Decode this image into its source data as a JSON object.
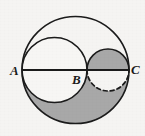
{
  "figure": {
    "background_color": "#f5f4f2",
    "stroke_color": "#1b1b1b",
    "shade_color": "#a8a8a8",
    "unshaded_color": "#f7f6f4",
    "canvas": {
      "width": 145,
      "height": 136
    },
    "baseline": {
      "y": 70,
      "x_start": 22,
      "x_end": 129,
      "name": "diameter-line-AC"
    },
    "points": [
      {
        "id": "A",
        "label": "A",
        "x": 22,
        "y": 70,
        "label_x": 10,
        "label_y": 75
      },
      {
        "id": "B",
        "label": "B",
        "x": 87,
        "y": 70,
        "label_x": 72,
        "label_y": 84
      },
      {
        "id": "C",
        "label": "C",
        "x": 129,
        "y": 70,
        "label_x": 131,
        "label_y": 74
      }
    ],
    "circles": [
      {
        "id": "big",
        "name": "outer-circle-AC",
        "cx": 75.5,
        "cy": 70,
        "r": 53.5,
        "stroke_width": 1.6,
        "dashed": false
      },
      {
        "id": "medium",
        "name": "inner-circle-AB",
        "cx": 54.5,
        "cy": 70,
        "r": 32.5,
        "stroke_width": 1.6,
        "dashed": false
      },
      {
        "id": "small",
        "name": "inner-circle-BC",
        "cx": 108,
        "cy": 70,
        "r": 21,
        "stroke_width": 1.6,
        "dashed": false
      }
    ],
    "dashed_arc": {
      "name": "dashed-lower-arc-BC",
      "from_x": 87,
      "from_y": 70,
      "to_x": 129,
      "to_y": 70,
      "rx": 21,
      "ry": 21,
      "dash_pattern": "4 3",
      "stroke_width": 1.7
    },
    "shaded_regions": [
      {
        "id": "upper-small-semicircle",
        "description": "upper half of small circle BC, shaded"
      },
      {
        "id": "lower-big-minus-lower-medium-minus-lower-small",
        "description": "lower half of big circle AC excluding lower half of medium circle AB and lower half of small circle BC, shaded"
      }
    ]
  }
}
